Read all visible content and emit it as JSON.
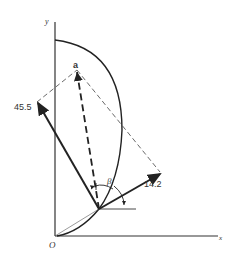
{
  "diagram": {
    "axes": {
      "x_label": "x",
      "y_label": "y",
      "origin_label": "O"
    },
    "point_label": "a",
    "vectors": [
      {
        "name": "force-1",
        "label": "45.5"
      },
      {
        "name": "force-2",
        "label": "14.2"
      }
    ],
    "angle_label": "β",
    "colors": {
      "stroke": "#222222",
      "background": "#ffffff"
    }
  }
}
